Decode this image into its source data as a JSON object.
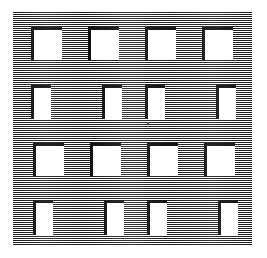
{
  "figure": {
    "background_color": "#ffffff",
    "panel": {
      "name": "hatched-panel",
      "x": 13,
      "y": 12,
      "width": 239,
      "height": 234,
      "hatch_line_color": "#1a1a1a",
      "hatch_gap_color": "#ffffff",
      "hatch_period_px": 2,
      "hatch_orientation": "horizontal"
    },
    "bracket": {
      "color": "#0d0d0d",
      "thickness_px": 3,
      "sides": "top-left"
    },
    "grid": {
      "rows": 4,
      "columns": 4,
      "total_cells": 16
    },
    "speck": {
      "x": 147,
      "y": 122,
      "size": 2,
      "color": "#555555"
    },
    "cells": [
      {
        "id": "r1c1",
        "row": 1,
        "col": 1,
        "x": 31,
        "y": 27,
        "w": 31,
        "h": 33,
        "bracket": "top-left"
      },
      {
        "id": "r1c2",
        "row": 1,
        "col": 2,
        "x": 88,
        "y": 27,
        "w": 31,
        "h": 33,
        "bracket": "top-left"
      },
      {
        "id": "r1c3",
        "row": 1,
        "col": 3,
        "x": 145,
        "y": 27,
        "w": 31,
        "h": 33,
        "bracket": "top-left"
      },
      {
        "id": "r1c4",
        "row": 1,
        "col": 4,
        "x": 202,
        "y": 27,
        "w": 31,
        "h": 33,
        "bracket": "top-left"
      },
      {
        "id": "r2c1",
        "row": 2,
        "col": 1,
        "x": 31,
        "y": 85,
        "w": 20,
        "h": 34,
        "bracket": "top-left"
      },
      {
        "id": "r2c2",
        "row": 2,
        "col": 2,
        "x": 102,
        "y": 85,
        "w": 20,
        "h": 34,
        "bracket": "top-left"
      },
      {
        "id": "r2c3",
        "row": 2,
        "col": 3,
        "x": 145,
        "y": 85,
        "w": 20,
        "h": 34,
        "bracket": "top-left"
      },
      {
        "id": "r2c4",
        "row": 2,
        "col": 4,
        "x": 216,
        "y": 85,
        "w": 20,
        "h": 34,
        "bracket": "top-left"
      },
      {
        "id": "r3c1",
        "row": 3,
        "col": 1,
        "x": 33,
        "y": 143,
        "w": 31,
        "h": 33,
        "bracket": "top-left"
      },
      {
        "id": "r3c2",
        "row": 3,
        "col": 2,
        "x": 90,
        "y": 143,
        "w": 31,
        "h": 33,
        "bracket": "top-left"
      },
      {
        "id": "r3c3",
        "row": 3,
        "col": 3,
        "x": 147,
        "y": 143,
        "w": 31,
        "h": 33,
        "bracket": "top-left"
      },
      {
        "id": "r3c4",
        "row": 3,
        "col": 4,
        "x": 204,
        "y": 143,
        "w": 31,
        "h": 33,
        "bracket": "top-left"
      },
      {
        "id": "r4c1",
        "row": 4,
        "col": 1,
        "x": 33,
        "y": 200,
        "w": 20,
        "h": 35,
        "bracket": "top-left"
      },
      {
        "id": "r4c2",
        "row": 4,
        "col": 2,
        "x": 104,
        "y": 200,
        "w": 20,
        "h": 35,
        "bracket": "top-left"
      },
      {
        "id": "r4c3",
        "row": 4,
        "col": 3,
        "x": 147,
        "y": 200,
        "w": 20,
        "h": 35,
        "bracket": "top-left"
      },
      {
        "id": "r4c4",
        "row": 4,
        "col": 4,
        "x": 218,
        "y": 200,
        "w": 20,
        "h": 35,
        "bracket": "top-left"
      }
    ]
  }
}
